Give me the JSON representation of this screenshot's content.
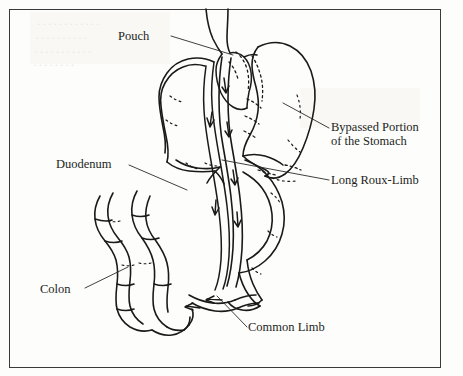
{
  "figure": {
    "domain": "medical-anatomical-illustration",
    "title_visible": false,
    "style": "black-and-white line drawing, scanned book page",
    "border": {
      "visible": true,
      "color": "#3a3a3a"
    },
    "background_color": "#fdfdfb",
    "ink_color": "#1a1a1a"
  },
  "labels": {
    "pouch": "Pouch",
    "duodenum": "Duodenum",
    "colon": "Colon",
    "bypassed_stomach": "Bypassed Portion of the Stomach",
    "bypassed_stomach_line1": "Bypassed Portion",
    "bypassed_stomach_line2": "of the Stomach",
    "long_roux_limb": "Long Roux-Limb",
    "common_limb": "Common Limb"
  },
  "anatomy": {
    "parts": [
      {
        "name": "esophagus",
        "label": null
      },
      {
        "name": "gastric-pouch",
        "label": "Pouch"
      },
      {
        "name": "bypassed-stomach",
        "label": "Bypassed Portion of the Stomach"
      },
      {
        "name": "duodenum",
        "label": "Duodenum"
      },
      {
        "name": "roux-limb",
        "label": "Long Roux-Limb"
      },
      {
        "name": "biliopancreatic-limb",
        "label": null
      },
      {
        "name": "common-limb",
        "label": "Common Limb"
      },
      {
        "name": "colon",
        "label": "Colon"
      },
      {
        "name": "jejunojejunostomy",
        "label": null
      }
    ],
    "flow_arrows_count": 6,
    "staple_line_marks": "dashed"
  },
  "leader_lines": [
    {
      "label": "Pouch",
      "from": [
        171,
        36
      ],
      "to": [
        233,
        55
      ]
    },
    {
      "label": "Duodenum",
      "from": [
        129,
        165
      ],
      "to": [
        187,
        190
      ]
    },
    {
      "label": "Colon",
      "from": [
        85,
        288
      ],
      "to": [
        128,
        267
      ]
    },
    {
      "label": "Bypassed Portion of the Stomach",
      "from": [
        329,
        128
      ],
      "to": [
        283,
        103
      ]
    },
    {
      "label": "Long Roux-Limb",
      "from": [
        329,
        180
      ],
      "to": [
        222,
        160
      ]
    },
    {
      "label": "Common Limb",
      "from": [
        247,
        327
      ],
      "to": [
        217,
        296
      ]
    }
  ],
  "bleed_through": [
    {
      "text": "············",
      "x": 36,
      "y": 16
    },
    {
      "text": "··········",
      "x": 34,
      "y": 30
    },
    {
      "text": "···········",
      "x": 33,
      "y": 44
    },
    {
      "text": "········",
      "x": 32,
      "y": 57
    }
  ]
}
